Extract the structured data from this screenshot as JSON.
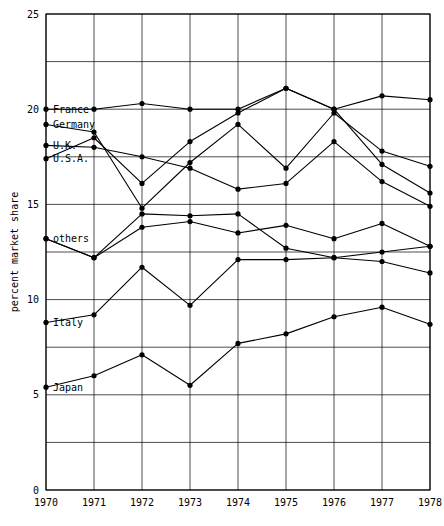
{
  "chart_data": {
    "type": "line",
    "title": "",
    "xlabel": "",
    "ylabel": "percent market share",
    "x": [
      1970,
      1971,
      1972,
      1973,
      1974,
      1975,
      1976,
      1977,
      1978
    ],
    "xtick_labels": [
      "1970",
      "1971",
      "1972",
      "1973",
      "1974",
      "1975",
      "1976",
      "1977",
      "1978"
    ],
    "ytick_labels": [
      "0",
      "5",
      "10",
      "15",
      "20",
      "25"
    ],
    "yticks": [
      0,
      5,
      10,
      15,
      20,
      25
    ],
    "ylim": [
      0,
      25
    ],
    "xlim": [
      1970,
      1978
    ],
    "grid": true,
    "minor_gridlines": [
      2.5,
      7.5,
      12.5,
      17.5,
      22.5
    ],
    "legend_position": "inline-left",
    "marker": "filled-circle",
    "line_color": "#000000",
    "series": [
      {
        "name": "France",
        "label": "France",
        "label_x": 1970,
        "label_y": 20.0,
        "values": [
          20.0,
          20.0,
          20.3,
          20.0,
          20.0,
          21.1,
          20.0,
          20.7,
          20.5
        ]
      },
      {
        "name": "Germany",
        "label": "Germany",
        "label_x": 1970,
        "label_y": 19.2,
        "values": [
          19.2,
          18.8,
          14.8,
          17.2,
          19.2,
          16.9,
          19.8,
          17.8,
          17.0
        ]
      },
      {
        "name": "U.K.",
        "label": "U.K.",
        "label_x": 1970,
        "label_y": 18.1,
        "values": [
          18.1,
          18.0,
          17.5,
          16.9,
          15.8,
          16.1,
          18.3,
          16.2,
          14.9
        ]
      },
      {
        "name": "U.S.A.",
        "label": "U.S.A.",
        "label_x": 1970,
        "label_y": 17.4,
        "values": [
          17.4,
          18.5,
          16.1,
          18.3,
          19.8,
          21.1,
          20.0,
          17.1,
          15.6
        ]
      },
      {
        "name": "others",
        "label": "others",
        "label_x": 1970,
        "label_y": 13.2,
        "values": [
          13.2,
          12.2,
          13.8,
          14.1,
          13.5,
          13.9,
          13.2,
          14.0,
          12.8
        ]
      },
      {
        "name": "Italy",
        "label": "Italy",
        "label_x": 1970,
        "label_y": 8.8,
        "values": [
          8.8,
          9.2,
          11.7,
          9.7,
          12.1,
          12.1,
          12.2,
          12.0,
          11.4
        ]
      },
      {
        "name": "Japan",
        "label": "Japan",
        "label_x": 1970,
        "label_y": 5.4,
        "values": [
          5.4,
          6.0,
          7.1,
          5.5,
          7.7,
          8.2,
          9.1,
          9.6,
          8.7
        ]
      }
    ],
    "extra_series": [
      {
        "name": "secondary-mid",
        "label": "",
        "values": [
          13.2,
          12.2,
          14.5,
          14.4,
          14.5,
          12.7,
          12.2,
          12.5,
          12.8
        ]
      }
    ]
  }
}
